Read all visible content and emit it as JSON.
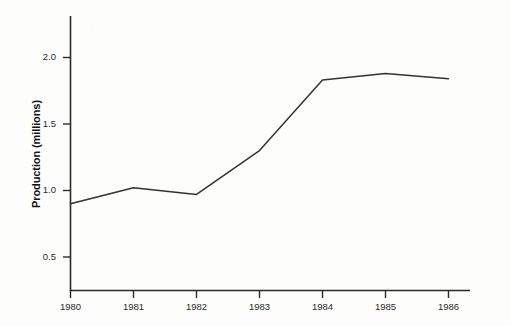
{
  "chart_data": {
    "type": "line",
    "title": "",
    "xlabel": "",
    "ylabel": "Production (millions)",
    "categories": [
      "1980",
      "1981",
      "1982",
      "1983",
      "1984",
      "1985",
      "1986"
    ],
    "x": [
      1980,
      1981,
      1982,
      1983,
      1984,
      1985,
      1986
    ],
    "values": [
      0.9,
      1.02,
      0.97,
      1.3,
      1.83,
      1.88,
      1.84
    ],
    "series": [
      {
        "name": "Production",
        "values": [
          0.9,
          1.02,
          0.97,
          1.3,
          1.83,
          1.88,
          1.84
        ]
      }
    ],
    "ytick_labels": [
      "0.5",
      "1.0",
      "1.5",
      "2.0"
    ],
    "yticks": [
      0.5,
      1.0,
      1.5,
      2.0
    ],
    "ylim": [
      0.0,
      2.28
    ],
    "xlim": [
      1980,
      1986
    ],
    "grid": false,
    "legend": false,
    "legend_position": "none",
    "line_color": "#333333",
    "axis_color": "#2b2b2b",
    "background_color": "#fdfdfc",
    "markers": false
  }
}
